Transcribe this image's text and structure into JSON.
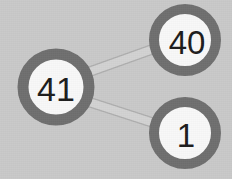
{
  "diagram": {
    "type": "node-link-graph",
    "background_color": "#c9c9c9",
    "node_fill_color": "#f8f8f8",
    "node_border_color": "#6e6e6e",
    "edge_fill_color": "#d2d2d2",
    "edge_border_color": "#aeaeae",
    "label_color": "#1b1b1b",
    "nodes": [
      {
        "id": "node-41",
        "label": "41",
        "cx": 56,
        "cy": 87,
        "r": 33,
        "border_width": 11,
        "font_size": 34
      },
      {
        "id": "node-40",
        "label": "40",
        "cx": 185,
        "cy": 40,
        "r": 31,
        "border_width": 10,
        "font_size": 33
      },
      {
        "id": "node-1",
        "label": "1",
        "cx": 185,
        "cy": 133,
        "r": 31,
        "border_width": 10,
        "font_size": 33
      }
    ],
    "edges": [
      {
        "id": "edge-41-40",
        "source": "node-41",
        "target": "node-40",
        "source_label": "41",
        "target_label": "40"
      },
      {
        "id": "edge-41-1",
        "source": "node-41",
        "target": "node-1",
        "source_label": "41",
        "target_label": "1"
      }
    ]
  }
}
